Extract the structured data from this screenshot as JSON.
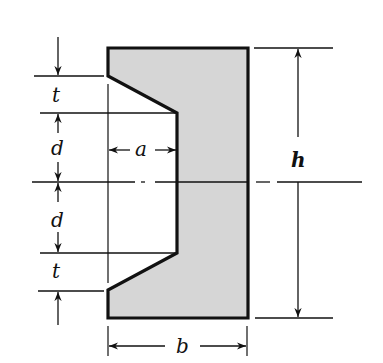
{
  "diagram": {
    "type": "cross-section",
    "colors": {
      "fill": "#d6d6d6",
      "outline": "#111111",
      "background": "#ffffff"
    },
    "labels": {
      "t_top": "t",
      "d_top": "d",
      "d_bottom": "d",
      "t_bottom": "t",
      "a": "a",
      "h": "h",
      "b": "b"
    }
  }
}
